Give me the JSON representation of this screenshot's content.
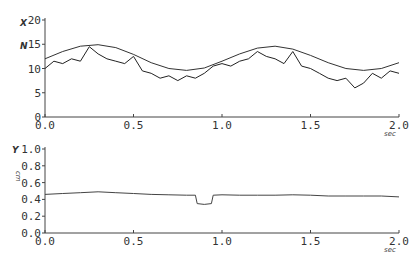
{
  "chart_data": [
    {
      "type": "line",
      "title": "",
      "ylabel": "X",
      "ylabel_unit": "N",
      "xlabel": "sec",
      "xlim": [
        0.0,
        2.0
      ],
      "ylim": [
        0,
        20
      ],
      "x_ticks": [
        "0.0",
        "0.5",
        "1.0",
        "1.5",
        "2.0"
      ],
      "y_ticks": [
        "0",
        "5",
        "10",
        "15",
        "20"
      ],
      "grid": false,
      "series": [
        {
          "name": "envelope (sinusoid)",
          "x": [
            0.0,
            0.1,
            0.2,
            0.3,
            0.4,
            0.5,
            0.6,
            0.7,
            0.8,
            0.9,
            1.0,
            1.1,
            1.2,
            1.3,
            1.4,
            1.5,
            1.6,
            1.7,
            1.8,
            1.9,
            2.0
          ],
          "values": [
            12.0,
            13.5,
            14.6,
            14.9,
            14.3,
            12.9,
            11.2,
            10.0,
            9.6,
            10.1,
            11.5,
            13.0,
            14.2,
            14.6,
            14.0,
            12.7,
            11.2,
            10.0,
            9.6,
            10.0,
            11.2
          ]
        },
        {
          "name": "measured force (noisy)",
          "x": [
            0.0,
            0.05,
            0.1,
            0.15,
            0.2,
            0.25,
            0.3,
            0.35,
            0.4,
            0.45,
            0.5,
            0.55,
            0.6,
            0.65,
            0.7,
            0.75,
            0.8,
            0.85,
            0.9,
            0.95,
            1.0,
            1.05,
            1.1,
            1.15,
            1.2,
            1.25,
            1.3,
            1.35,
            1.4,
            1.45,
            1.5,
            1.55,
            1.6,
            1.65,
            1.7,
            1.75,
            1.8,
            1.85,
            1.9,
            1.95,
            2.0
          ],
          "values": [
            10.0,
            11.5,
            11.0,
            12.0,
            11.5,
            14.5,
            13.0,
            12.0,
            11.5,
            11.0,
            12.5,
            9.5,
            9.0,
            8.0,
            8.5,
            7.5,
            8.5,
            8.0,
            9.0,
            10.5,
            11.0,
            10.5,
            11.5,
            12.0,
            13.5,
            12.5,
            12.0,
            11.0,
            13.5,
            10.5,
            10.0,
            9.0,
            8.0,
            7.5,
            8.0,
            6.0,
            7.0,
            9.0,
            8.0,
            9.5,
            9.0
          ]
        }
      ]
    },
    {
      "type": "line",
      "title": "",
      "ylabel": "Y",
      "ylabel_unit": "cm",
      "xlabel": "sec",
      "xlim": [
        0.0,
        2.0
      ],
      "ylim": [
        0.0,
        1.0
      ],
      "x_ticks": [
        "0.0",
        "0.5",
        "1.0",
        "1.5",
        "2.0"
      ],
      "y_ticks": [
        "0.0",
        "0.2",
        "0.4",
        "0.6",
        "0.8",
        "1.0"
      ],
      "grid": false,
      "series": [
        {
          "name": "position",
          "x": [
            0.0,
            0.1,
            0.2,
            0.3,
            0.4,
            0.5,
            0.6,
            0.7,
            0.8,
            0.85,
            0.86,
            0.9,
            0.94,
            0.95,
            1.0,
            1.1,
            1.2,
            1.3,
            1.4,
            1.5,
            1.6,
            1.7,
            1.8,
            1.9,
            2.0
          ],
          "values": [
            0.46,
            0.47,
            0.48,
            0.49,
            0.48,
            0.47,
            0.46,
            0.455,
            0.45,
            0.45,
            0.35,
            0.34,
            0.35,
            0.45,
            0.455,
            0.45,
            0.45,
            0.45,
            0.455,
            0.45,
            0.44,
            0.44,
            0.44,
            0.44,
            0.43
          ]
        }
      ]
    }
  ]
}
